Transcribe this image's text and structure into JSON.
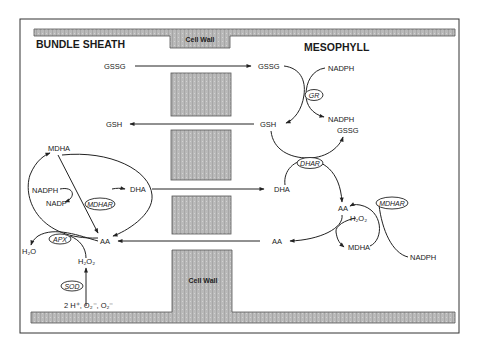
{
  "compartments": {
    "left_title": "BUNDLE SHEATH",
    "right_title": "MESOPHYLL",
    "cell_wall_top": "Cell Wall",
    "cell_wall_bottom": "Cell Wall"
  },
  "colors": {
    "wall_fill": "#b8b8b8",
    "wall_stroke": "#555555",
    "line": "#222222",
    "background": "#ffffff"
  },
  "transport": [
    {
      "from": "GSSG",
      "to": "GSSG",
      "direction": "bundle-sheath-to-mesophyll"
    },
    {
      "from": "GSH",
      "to": "GSH",
      "direction": "mesophyll-to-bundle-sheath"
    },
    {
      "from": "DHA",
      "to": "DHA",
      "direction": "bundle-sheath-to-mesophyll"
    },
    {
      "from": "AA",
      "to": "AA",
      "direction": "mesophyll-to-bundle-sheath"
    }
  ],
  "bundle_sheath": {
    "gssg": "GSSG",
    "gsh": "GSH",
    "mdha": "MDHA",
    "nadph": "NADPH",
    "nadp": "NADP",
    "mdhar": "MDHAR",
    "dha": "DHA",
    "aa": "AA",
    "apx": "APX",
    "h2o": "H₂O",
    "h2o2": "H₂O₂",
    "sod": "SOD",
    "superoxide": "2 H⁺, O₂⁻, O₂⁻"
  },
  "mesophyll": {
    "gssg": "GSSG",
    "nadph_top": "NADPH",
    "gr": "GR",
    "nadph_out": "NADPH",
    "gssg_2": "GSSG",
    "gsh": "GSH",
    "dhar": "DHAR",
    "dha": "DHA",
    "aa": "AA",
    "mdhar": "MDHAR",
    "h2o2": "H₂O₂",
    "mdha": "MDHA",
    "aa_out": "AA",
    "nadph_bottom": "NADPH"
  }
}
